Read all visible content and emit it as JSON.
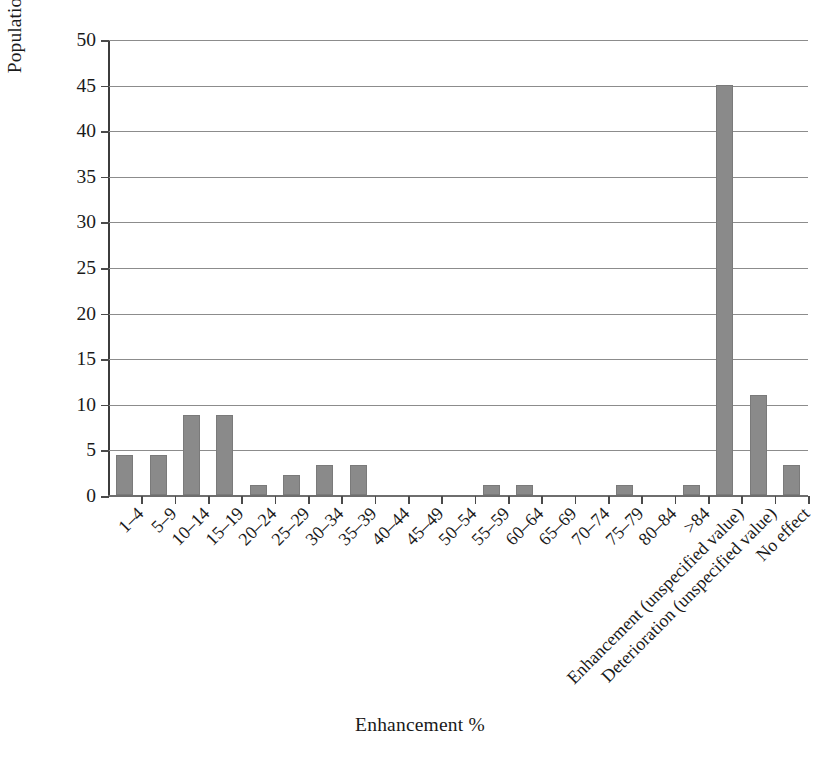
{
  "chart_data": {
    "type": "bar",
    "title": "",
    "xlabel": "Enhancement %",
    "ylabel": "Population proportion (%) (out of 91 observations)",
    "ylim": [
      0,
      50
    ],
    "ytick_step": 5,
    "grid": true,
    "legend": "none",
    "bar_color": "#8a8a8a",
    "observations_total": 91,
    "categories": [
      "1–4",
      "5–9",
      "10–14",
      "15–19",
      "20–24",
      "25–29",
      "30–34",
      "35–39",
      "40–44",
      "45–49",
      "50–54",
      "55–59",
      "60–64",
      "65–69",
      "70–74",
      "75–79",
      "80–84",
      ">84",
      "Enhancement (unspecified value)",
      "Deterioration (unspecified value)",
      "No effect"
    ],
    "values": [
      4.4,
      4.4,
      8.8,
      8.8,
      1.1,
      2.2,
      3.3,
      3.3,
      0,
      0,
      0,
      1.1,
      1.1,
      0,
      0,
      1.1,
      0,
      1.1,
      45.0,
      11.0,
      3.3
    ],
    "ytick_labels": [
      "0",
      "5",
      "10",
      "15",
      "20",
      "25",
      "30",
      "35",
      "40",
      "45",
      "50"
    ],
    "ytick_values": [
      0,
      5,
      10,
      15,
      20,
      25,
      30,
      35,
      40,
      45,
      50
    ]
  }
}
